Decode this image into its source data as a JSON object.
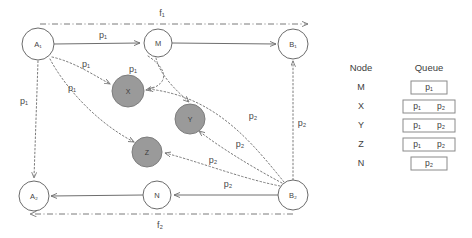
{
  "diagram": {
    "nodes": [
      {
        "id": "A1",
        "label": "A₁",
        "type": "open",
        "cx": 38,
        "cy": 44,
        "r": 16
      },
      {
        "id": "M",
        "label": "M",
        "type": "open",
        "cx": 158,
        "cy": 43,
        "r": 14
      },
      {
        "id": "B1",
        "label": "B₁",
        "type": "open",
        "cx": 293,
        "cy": 44,
        "r": 15
      },
      {
        "id": "A2",
        "label": "A₂",
        "type": "open",
        "cx": 34,
        "cy": 196,
        "r": 15
      },
      {
        "id": "N",
        "label": "N",
        "type": "open",
        "cx": 157,
        "cy": 195,
        "r": 14
      },
      {
        "id": "B2",
        "label": "B₂",
        "type": "open",
        "cx": 293,
        "cy": 195,
        "r": 15
      },
      {
        "id": "X",
        "label": "X",
        "type": "gray",
        "cx": 128,
        "cy": 91,
        "r": 16
      },
      {
        "id": "Y",
        "label": "Y",
        "type": "gray",
        "cx": 190,
        "cy": 119,
        "r": 15
      },
      {
        "id": "Z",
        "label": "Z",
        "type": "gray",
        "cx": 147,
        "cy": 152,
        "r": 15
      }
    ],
    "edge_labels": [
      {
        "name": "label-a1-m",
        "text": "p₁",
        "x": 103,
        "y": 36
      },
      {
        "name": "label-a1-x",
        "text": "p₁",
        "x": 86,
        "y": 65
      },
      {
        "name": "label-m-x",
        "text": "p₁",
        "x": 133,
        "y": 70
      },
      {
        "name": "label-a1-z",
        "text": "p₁",
        "x": 72,
        "y": 89
      },
      {
        "name": "label-a1-a2",
        "text": "p₁",
        "x": 24,
        "y": 102
      },
      {
        "name": "label-b2-y",
        "text": "p₂",
        "x": 253,
        "y": 117
      },
      {
        "name": "label-b2-z",
        "text": "p₂",
        "x": 240,
        "y": 145
      },
      {
        "name": "label-y-z",
        "text": "p₂",
        "x": 213,
        "y": 161
      },
      {
        "name": "label-b2-b1",
        "text": "p₂",
        "x": 302,
        "y": 124
      },
      {
        "name": "label-b2-n",
        "text": "p₂",
        "x": 228,
        "y": 185
      }
    ],
    "flow_labels": [
      {
        "name": "flow-label-f1",
        "text": "f₁",
        "x": 162,
        "y": 14
      },
      {
        "name": "flow-label-f2",
        "text": "f₂",
        "x": 160,
        "y": 226
      }
    ],
    "legend": {
      "headers": {
        "node": "Node",
        "queue": "Queue"
      },
      "rows": [
        {
          "node": "M",
          "queue": [
            "p₁"
          ]
        },
        {
          "node": "X",
          "queue": [
            "p₁",
            "p₂"
          ]
        },
        {
          "node": "Y",
          "queue": [
            "p₁",
            "p₂"
          ]
        },
        {
          "node": "Z",
          "queue": [
            "p₁",
            "p₂"
          ]
        },
        {
          "node": "N",
          "queue": [
            "p₂"
          ]
        }
      ]
    },
    "colors": {
      "gray_node_fill": "#9a9a9a",
      "stroke": "#6e6e6e",
      "dotted_stroke": "#7b7b7b",
      "text": "#4a4a4a",
      "background": "#ffffff"
    }
  }
}
